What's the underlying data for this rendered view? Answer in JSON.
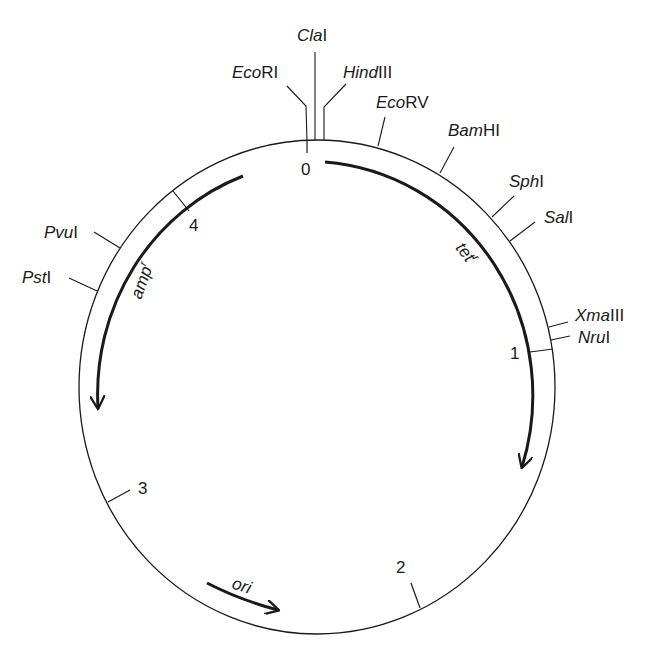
{
  "diagram": {
    "type": "plasmid-map",
    "center": [
      317,
      387
    ],
    "radius_x": 238,
    "radius_y": 247,
    "stroke_color": "#1a1a1a",
    "scale_ticks": [
      {
        "label": "0",
        "angle": 0
      },
      {
        "label": "1",
        "angle": 81
      },
      {
        "label": "2",
        "angle": 154
      },
      {
        "label": "3",
        "angle": 242
      },
      {
        "label": "4",
        "angle": 322
      }
    ],
    "restriction_sites": [
      {
        "italic": "Eco",
        "roman": "RI",
        "angle": -2.4
      },
      {
        "italic": "Cla",
        "roman": "I",
        "angle": 0
      },
      {
        "italic": "Hind",
        "roman": "III",
        "angle": 1.7
      },
      {
        "italic": "Eco",
        "roman": "RV",
        "angle": 14.5
      },
      {
        "italic": "Bam",
        "roman": "HI",
        "angle": 30
      },
      {
        "italic": "Sph",
        "roman": "I",
        "angle": 47
      },
      {
        "italic": "Sal",
        "roman": "I",
        "angle": 54
      },
      {
        "italic": "Xma",
        "roman": "III",
        "angle": 76
      },
      {
        "italic": "Nru",
        "roman": "I",
        "angle": 79
      },
      {
        "italic": "Pvu",
        "roman": "I",
        "angle": 304
      },
      {
        "italic": "Pst",
        "roman": "I",
        "angle": 293
      }
    ],
    "genes": [
      {
        "name": "tet",
        "superscript": "r",
        "direction": "clockwise",
        "start_angle": 3,
        "end_angle": 150
      },
      {
        "name": "amp",
        "superscript": "r",
        "direction": "counterclockwise",
        "start_angle": 340,
        "end_angle": 265
      },
      {
        "name": "ori",
        "superscript": "",
        "direction": "clockwise",
        "start_angle": 232,
        "end_angle": 207
      }
    ]
  }
}
